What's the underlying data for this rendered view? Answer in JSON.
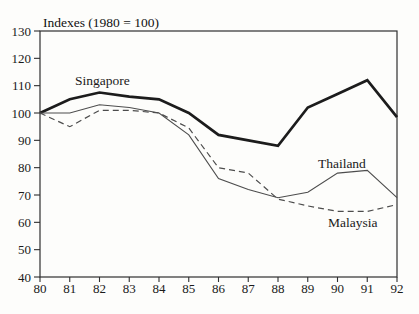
{
  "chart_data": {
    "type": "line",
    "title": "Indexes (1980 = 100)",
    "categories": [
      "80",
      "81",
      "82",
      "83",
      "84",
      "85",
      "86",
      "87",
      "88",
      "89",
      "90",
      "91",
      "92"
    ],
    "series": [
      {
        "name": "Singapore",
        "values": [
          100,
          105,
          107.5,
          106,
          105,
          100,
          92,
          90,
          88,
          102,
          107,
          112,
          98.5
        ],
        "color": "#1c1c1c",
        "width": 2.7,
        "dash": ""
      },
      {
        "name": "Thailand",
        "values": [
          100,
          100,
          103,
          102,
          100,
          92,
          76,
          72,
          69,
          71,
          78,
          79,
          69
        ],
        "color": "#4d4d4d",
        "width": 1.1,
        "dash": ""
      },
      {
        "name": "Malaysia",
        "values": [
          100,
          95,
          101,
          101,
          100,
          94.5,
          80,
          78,
          68.5,
          66,
          64,
          64,
          66.5
        ],
        "color": "#4d4d4d",
        "width": 1.2,
        "dash": "6 4"
      }
    ],
    "annotations": [
      {
        "text": "Singapore",
        "x": 1.18,
        "y": 112
      },
      {
        "text": "Thailand",
        "x": 9.34,
        "y": 81.5
      },
      {
        "text": "Malaysia",
        "x": 9.68,
        "y": 60
      }
    ],
    "xlabel": "",
    "ylabel": "",
    "ylim": [
      40,
      130
    ],
    "y_ticks": [
      40,
      50,
      60,
      70,
      80,
      90,
      100,
      110,
      120,
      130
    ],
    "grid": false,
    "legend": "inline-labels"
  }
}
